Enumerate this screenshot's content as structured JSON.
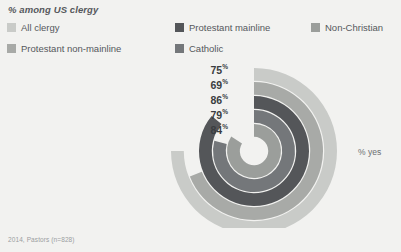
{
  "chart_title": "% among US clergy",
  "axis_caption": "% yes",
  "footnote": "2014, Pastors (n=828)",
  "legend": {
    "items": [
      {
        "label": "All clergy",
        "color": "#c9cbc8"
      },
      {
        "label": "Protestant non-mainline",
        "color": "#a8aaa7"
      },
      {
        "label": "Protestant mainline",
        "color": "#545659"
      },
      {
        "label": "Catholic",
        "color": "#74777a"
      },
      {
        "label": "Non-Christian",
        "color": "#9b9e9b"
      }
    ]
  },
  "chart_data": {
    "type": "bar",
    "subtype": "radial-bar",
    "title": "% among US clergy",
    "xlabel": "",
    "ylabel": "% yes",
    "ylim": [
      0,
      100
    ],
    "grid": false,
    "legend_position": "top",
    "start_angle_deg": 0,
    "direction": "clockwise",
    "categories": [
      "All clergy",
      "Protestant non-mainline",
      "Protestant mainline",
      "Catholic",
      "Non-Christian"
    ],
    "values": [
      75,
      69,
      86,
      79,
      84
    ],
    "value_labels": [
      "75%",
      "69%",
      "86%",
      "79%",
      "84%"
    ],
    "colors": [
      "#c9cbc8",
      "#a8aaa7",
      "#545659",
      "#74777a",
      "#9b9e9b"
    ],
    "ring_order_outer_to_inner": [
      "All clergy",
      "Protestant non-mainline",
      "Protestant mainline",
      "Catholic",
      "Non-Christian"
    ]
  },
  "values_display": [
    {
      "num": "75",
      "pct": "%"
    },
    {
      "num": "69",
      "pct": "%"
    },
    {
      "num": "86",
      "pct": "%"
    },
    {
      "num": "79",
      "pct": "%"
    },
    {
      "num": "84",
      "pct": "%"
    }
  ]
}
